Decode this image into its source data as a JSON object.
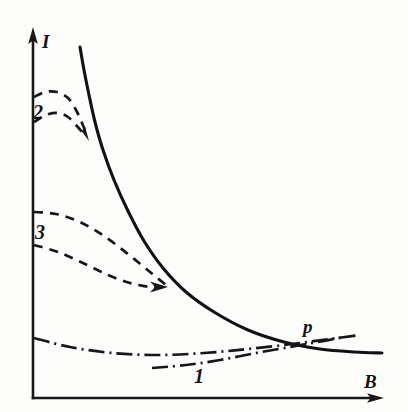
{
  "figure": {
    "title": "",
    "background_color": "#fdfdfc",
    "ink_color": "#17171a"
  },
  "axes": {
    "y_label": "I",
    "x_label": "B",
    "y_axis_name": "current-axis",
    "x_axis_name": "magnetic-field-axis",
    "origin_px": [
      33,
      398
    ],
    "x_end_px": [
      382,
      398
    ],
    "y_end_px": [
      33,
      30
    ]
  },
  "labels": {
    "curve1": "1",
    "curve2": "2",
    "curve3": "3",
    "point_p": "p"
  },
  "chart_data": {
    "type": "line",
    "title": "",
    "xlabel": "B",
    "ylabel": "I",
    "grid": false,
    "legend": "inline-curve-labels",
    "axis_arrows": true,
    "xlim": [
      0,
      1
    ],
    "ylim": [
      0,
      1
    ],
    "annotations": [
      {
        "text": "p",
        "x_px": 310,
        "y_px": 326,
        "note": "crossing point of curve 1 and main solid curve"
      },
      {
        "text": "2",
        "x_px": 36,
        "y_px": 117,
        "note": "label for upper dashed pair"
      },
      {
        "text": "3",
        "x_px": 38,
        "y_px": 237,
        "note": "label for middle dashed pair"
      },
      {
        "text": "1",
        "x_px": 199,
        "y_px": 381,
        "note": "label for dash-dot pair"
      }
    ],
    "series": [
      {
        "name": "main-solid-curve",
        "style": "solid",
        "arrow": false,
        "points_px": [
          [
            80,
            47
          ],
          [
            84,
            70
          ],
          [
            89,
            95
          ],
          [
            95,
            122
          ],
          [
            103,
            150
          ],
          [
            114,
            180
          ],
          [
            128,
            211
          ],
          [
            144,
            241
          ],
          [
            163,
            268
          ],
          [
            186,
            292
          ],
          [
            214,
            312
          ],
          [
            248,
            330
          ],
          [
            284,
            342
          ],
          [
            320,
            349
          ],
          [
            355,
            352
          ],
          [
            382,
            353
          ]
        ]
      },
      {
        "name": "curve-2-upper",
        "style": "dashed",
        "arrow": true,
        "points_px": [
          [
            34,
            97
          ],
          [
            45,
            92
          ],
          [
            57,
            92
          ],
          [
            68,
            98
          ],
          [
            76,
            110
          ],
          [
            82,
            123
          ],
          [
            86,
            133
          ]
        ]
      },
      {
        "name": "curve-2-lower",
        "style": "dashed",
        "arrow": true,
        "points_px": [
          [
            34,
            122
          ],
          [
            46,
            115
          ],
          [
            58,
            113
          ],
          [
            68,
            117
          ],
          [
            76,
            125
          ],
          [
            82,
            132
          ],
          [
            86,
            137
          ]
        ]
      },
      {
        "name": "curve-3-upper",
        "style": "dashed",
        "arrow": false,
        "points_px": [
          [
            34,
            212
          ],
          [
            56,
            214
          ],
          [
            80,
            222
          ],
          [
            104,
            236
          ],
          [
            128,
            254
          ],
          [
            150,
            272
          ],
          [
            166,
            285
          ]
        ]
      },
      {
        "name": "curve-3-lower",
        "style": "dashed",
        "arrow": true,
        "points_px": [
          [
            34,
            245
          ],
          [
            58,
            252
          ],
          [
            83,
            263
          ],
          [
            108,
            275
          ],
          [
            130,
            283
          ],
          [
            150,
            287
          ],
          [
            163,
            287
          ]
        ]
      },
      {
        "name": "curve-1-upper",
        "style": "dash-dot",
        "arrow": false,
        "points_px": [
          [
            34,
            338
          ],
          [
            70,
            347
          ],
          [
            112,
            353
          ],
          [
            158,
            355
          ],
          [
            204,
            353
          ],
          [
            248,
            349
          ],
          [
            292,
            344
          ],
          [
            330,
            339
          ],
          [
            360,
            335
          ]
        ]
      },
      {
        "name": "curve-1-lower",
        "style": "dash-dot",
        "arrow": false,
        "points_px": [
          [
            152,
            368
          ],
          [
            186,
            365
          ],
          [
            220,
            360
          ],
          [
            256,
            353
          ],
          [
            290,
            347
          ],
          [
            318,
            342
          ],
          [
            344,
            337
          ]
        ]
      }
    ]
  }
}
